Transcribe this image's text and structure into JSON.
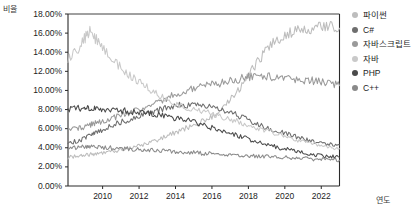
{
  "chart_data": {
    "type": "line",
    "title": "",
    "xlabel": "연도",
    "ylabel": "비율",
    "grid": false,
    "legend_position": "right",
    "xlim": [
      2008.1,
      2023.0
    ],
    "ylim": [
      0,
      18
    ],
    "x_ticks": [
      2010,
      2012,
      2014,
      2016,
      2018,
      2020,
      2022
    ],
    "x_tick_labels": [
      "2010",
      "2012",
      "2014",
      "2016",
      "2018",
      "2020",
      "2022"
    ],
    "y_ticks": [
      0,
      2,
      4,
      6,
      8,
      10,
      12,
      14,
      16,
      18
    ],
    "y_tick_labels": [
      "0.00%",
      "2.00%",
      "4.00%",
      "6.00%",
      "8.00%",
      "10.00%",
      "12.00%",
      "14.00%",
      "16.00%",
      "18.00%"
    ],
    "y_unit": "%",
    "x": [
      2008.1,
      2008.6,
      2009.0,
      2009.3,
      2009.6,
      2010.0,
      2010.5,
      2011.0,
      2011.5,
      2012.0,
      2012.5,
      2013.0,
      2013.5,
      2014.0,
      2014.5,
      2015.0,
      2015.5,
      2016.0,
      2016.5,
      2017.0,
      2017.5,
      2018.0,
      2018.5,
      2019.0,
      2019.5,
      2020.0,
      2020.5,
      2021.0,
      2021.5,
      2022.0,
      2022.5,
      2023.0
    ],
    "series": [
      {
        "name": "파이썬",
        "color": "#bdbdbd",
        "values": [
          3.0,
          3.1,
          3.2,
          3.3,
          3.4,
          3.5,
          3.6,
          3.8,
          4.0,
          4.2,
          4.5,
          4.8,
          5.2,
          5.6,
          6.0,
          6.4,
          6.8,
          7.3,
          8.0,
          9.0,
          10.2,
          11.6,
          13.0,
          14.2,
          15.2,
          15.8,
          16.2,
          16.3,
          16.4,
          16.6,
          16.8,
          16.5
        ]
      },
      {
        "name": "C#",
        "color": "#6e6e6e",
        "values": [
          4.5,
          4.7,
          5.0,
          5.3,
          5.6,
          5.9,
          6.3,
          6.7,
          7.0,
          7.3,
          7.6,
          7.9,
          8.2,
          8.4,
          8.5,
          8.5,
          8.4,
          8.2,
          8.0,
          7.7,
          7.3,
          6.9,
          6.5,
          6.1,
          5.8,
          5.5,
          5.2,
          4.9,
          4.7,
          4.5,
          4.4,
          4.3
        ]
      },
      {
        "name": "자바스크립트",
        "color": "#9a9a9a",
        "values": [
          5.8,
          6.0,
          6.2,
          6.4,
          6.6,
          6.8,
          7.1,
          7.4,
          7.7,
          8.0,
          8.4,
          8.8,
          9.2,
          9.6,
          9.9,
          10.2,
          10.4,
          10.6,
          10.8,
          11.0,
          11.2,
          11.4,
          11.5,
          11.5,
          11.4,
          11.3,
          11.2,
          11.1,
          11.0,
          10.9,
          10.8,
          10.5
        ]
      },
      {
        "name": "자바",
        "color": "#c9c9c9",
        "values": [
          13.2,
          14.2,
          15.4,
          16.2,
          15.4,
          14.6,
          13.4,
          12.4,
          11.6,
          10.9,
          10.2,
          9.6,
          9.0,
          8.5,
          8.2,
          8.0,
          7.8,
          7.6,
          7.3,
          7.0,
          6.7,
          6.4,
          6.1,
          5.8,
          5.5,
          5.2,
          4.9,
          4.7,
          4.5,
          4.3,
          4.1,
          3.9
        ]
      },
      {
        "name": "PHP",
        "color": "#4a4a4a",
        "values": [
          8.0,
          8.1,
          8.2,
          8.2,
          8.2,
          8.1,
          8.0,
          7.9,
          7.8,
          7.7,
          7.6,
          7.5,
          7.3,
          7.1,
          6.9,
          6.7,
          6.4,
          6.1,
          5.8,
          5.5,
          5.2,
          4.9,
          4.6,
          4.3,
          4.1,
          3.9,
          3.7,
          3.5,
          3.3,
          3.2,
          3.1,
          3.0
        ]
      },
      {
        "name": "C++",
        "color": "#8a8a8a",
        "values": [
          4.0,
          4.0,
          4.1,
          4.1,
          4.1,
          4.0,
          4.0,
          3.9,
          3.9,
          3.8,
          3.8,
          3.7,
          3.7,
          3.6,
          3.5,
          3.5,
          3.4,
          3.4,
          3.3,
          3.3,
          3.2,
          3.2,
          3.1,
          3.1,
          3.0,
          3.0,
          2.9,
          2.9,
          2.8,
          2.8,
          2.7,
          2.7
        ]
      }
    ]
  },
  "legend": {
    "items": [
      {
        "label": "파이썬"
      },
      {
        "label": "C#"
      },
      {
        "label": "자바스크립트"
      },
      {
        "label": "자바"
      },
      {
        "label": "PHP"
      },
      {
        "label": "C++"
      }
    ]
  },
  "axis_color": "#2a2a2a"
}
